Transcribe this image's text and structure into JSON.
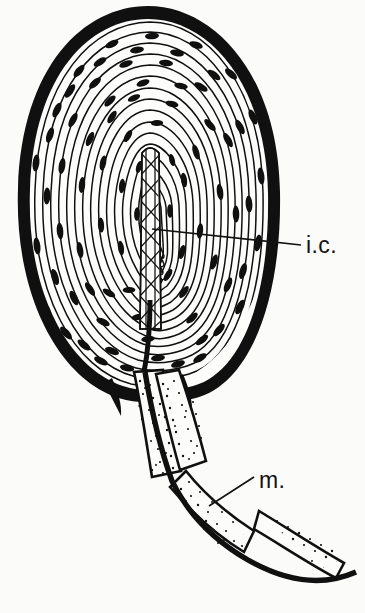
{
  "figure": {
    "kind": "anatomical-line-drawing",
    "background_color": "#fbfbfa",
    "ink_color": "#111010",
    "width": 365,
    "height": 613
  },
  "labels": [
    {
      "id": "inner-core",
      "text": "i.c.",
      "meaning": "inner core",
      "x": 306,
      "y": 251,
      "leader": {
        "from_x": 152,
        "from_y": 229,
        "to_x": 300,
        "to_y": 245
      }
    },
    {
      "id": "myelin",
      "text": "m.",
      "meaning": "myelin sheath",
      "x": 259,
      "y": 487,
      "leader": {
        "from_x": 210,
        "from_y": 505,
        "to_x": 253,
        "to_y": 477
      }
    }
  ],
  "structures": {
    "capsule": {
      "name": "outer capsule",
      "center_x": 148,
      "center_y": 200,
      "radius_x": 131,
      "radius_y": 194,
      "band_thickness": 13
    },
    "lamellae": {
      "name": "concentric lamellae",
      "count": 17,
      "nuclei_per_lamella": 9,
      "nucleus_shape": "spindle"
    },
    "inner_core": {
      "name": "inner core",
      "top_y": 150,
      "bottom_y": 330,
      "center_x": 150,
      "width": 15,
      "hatch_crossings": 11
    },
    "nerve_fiber": {
      "name": "myelinated nerve fiber",
      "segment_count": 4,
      "segments": [
        {
          "id": "internode-1",
          "label": "internode"
        },
        {
          "id": "internode-2",
          "label": "internode"
        },
        {
          "id": "internode-3",
          "label": "internode"
        },
        {
          "id": "internode-4",
          "label": "internode"
        }
      ]
    }
  }
}
